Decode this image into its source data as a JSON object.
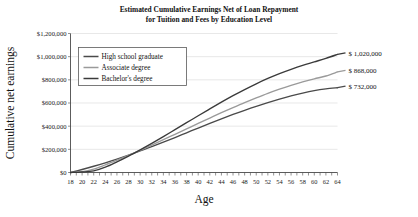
{
  "chart_data": {
    "type": "line",
    "title_line1": "Estimated Cumulative Earnings Net of Loan Repayment",
    "title_line2": "for Tuition and Fees by Education Level",
    "xlabel": "Age",
    "ylabel": "Cumulative net earnings",
    "xlim": [
      18,
      64
    ],
    "ylim": [
      0,
      1200000
    ],
    "grid": true,
    "legend_position": "top-left inside plot",
    "ytick_labels": [
      "$0",
      "$200,000",
      "$400,000",
      "$600,000",
      "$800,000",
      "$1,000,000",
      "$1,200,000"
    ],
    "ytick_values": [
      0,
      200000,
      400000,
      600000,
      800000,
      1000000,
      1200000
    ],
    "xtick_labels": [
      "18",
      "20",
      "22",
      "24",
      "26",
      "28",
      "30",
      "32",
      "34",
      "36",
      "38",
      "40",
      "42",
      "44",
      "46",
      "48",
      "50",
      "52",
      "54",
      "56",
      "58",
      "60",
      "62",
      "64"
    ],
    "xtick_values": [
      18,
      20,
      22,
      24,
      26,
      28,
      30,
      32,
      34,
      36,
      38,
      40,
      42,
      44,
      46,
      48,
      50,
      52,
      54,
      56,
      58,
      60,
      62,
      64
    ],
    "x": [
      18,
      20,
      22,
      24,
      26,
      28,
      30,
      32,
      34,
      36,
      38,
      40,
      42,
      44,
      46,
      48,
      50,
      52,
      54,
      56,
      58,
      60,
      62,
      64
    ],
    "series": [
      {
        "name": "High school graduate",
        "color": "#4a4a4a",
        "end_label": "$    732,000",
        "end_value": 732000,
        "values": [
          0,
          26000,
          54000,
          84000,
          116000,
          150000,
          186000,
          223000,
          262000,
          302000,
          343000,
          384000,
          424000,
          463000,
          501000,
          537000,
          571000,
          603000,
          633000,
          661000,
          686000,
          707000,
          722000,
          732000
        ]
      },
      {
        "name": "Associate degree",
        "color": "#9a9a9a",
        "end_label": "$    868,000",
        "end_value": 868000,
        "values": [
          0,
          8000,
          30000,
          66000,
          106000,
          148000,
          192000,
          237000,
          283000,
          330000,
          377000,
          424000,
          470000,
          516000,
          560000,
          603000,
          644000,
          683000,
          719000,
          752000,
          782000,
          809000,
          833000,
          868000
        ]
      },
      {
        "name": "Bachelor's degree",
        "color": "#3a3a3a",
        "end_label": "$ 1,020,000",
        "end_value": 1020000,
        "values": [
          0,
          4000,
          14000,
          46000,
          92000,
          142000,
          196000,
          252000,
          310000,
          370000,
          430000,
          490000,
          549000,
          607000,
          663000,
          716000,
          766000,
          812000,
          854000,
          891000,
          925000,
          955000,
          985000,
          1020000
        ]
      }
    ],
    "legend": [
      {
        "label": "High school graduate",
        "color": "#4a4a4a"
      },
      {
        "label": "Associate degree",
        "color": "#9a9a9a"
      },
      {
        "label": "Bachelor's degree",
        "color": "#3a3a3a"
      }
    ],
    "end_labels": [
      "$ 1,020,000",
      "$    868,000",
      "$    732,000"
    ]
  }
}
